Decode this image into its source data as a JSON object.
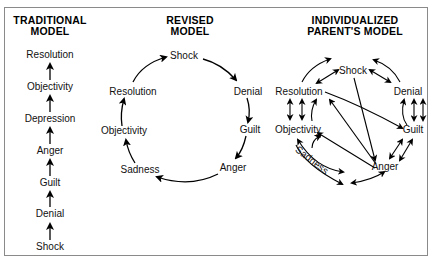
{
  "models": {
    "traditional": {
      "title_line1": "TRADITIONAL",
      "title_line2": "MODEL",
      "stages": [
        "Resolution",
        "Objectivity",
        "Depression",
        "Anger",
        "Guilt",
        "Denial",
        "Shock"
      ]
    },
    "revised": {
      "title_line1": "REVISED",
      "title_line2": "MODEL",
      "stages": {
        "shock": "Shock",
        "denial": "Denial",
        "guilt": "Guilt",
        "anger": "Anger",
        "sadness": "Sadness",
        "objectivity": "Objectivity",
        "resolution": "Resolution"
      }
    },
    "individualized": {
      "title_line1": "INDIVIDUALIZED",
      "title_line2": "PARENT'S MODEL",
      "stages": {
        "shock": "Shock",
        "denial": "Denial",
        "guilt": "Guilt",
        "anger": "Anger",
        "sadness": "Sadness",
        "objectivity": "Objectivity",
        "resolution": "Resolution"
      }
    }
  }
}
